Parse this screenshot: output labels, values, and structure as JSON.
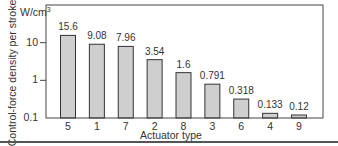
{
  "chart_data": {
    "type": "bar",
    "title": "",
    "xlabel": "Actuator type",
    "ylabel": "Control-force density per stroke",
    "yunit": "W/cm",
    "yunit_sup": "3",
    "yscale": "log",
    "ylim": [
      0.1,
      100
    ],
    "yticks": [
      {
        "value": 10,
        "label": "10"
      },
      {
        "value": 1,
        "label": "1"
      },
      {
        "value": 0.1,
        "label": "0.1"
      }
    ],
    "categories": [
      "5",
      "1",
      "7",
      "2",
      "8",
      "3",
      "6",
      "4",
      "9"
    ],
    "values": [
      15.6,
      9.08,
      7.96,
      3.54,
      1.6,
      0.791,
      0.318,
      0.133,
      0.12
    ],
    "value_labels": [
      "15.6",
      "9.08",
      "7.96",
      "3.54",
      "1.6",
      "0.791",
      "0.318",
      "0.133",
      "0.12"
    ],
    "grid": false,
    "legend": null,
    "colors": {
      "bar_fill": "#cfcfcf",
      "bar_stroke": "#333333",
      "axis": "#444444"
    }
  }
}
